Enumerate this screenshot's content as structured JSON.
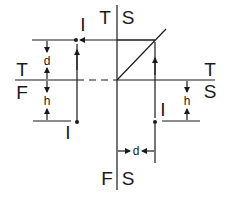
{
  "diagram": {
    "type": "quadrant-transformation-diagram",
    "quadrant_labels": {
      "top_left_axis_upper": "T",
      "top_left_axis_lower": "F",
      "top_axis_left": "T",
      "top_axis_right": "S",
      "right_axis_upper": "T",
      "right_axis_lower": "S",
      "bottom_axis_left": "F",
      "bottom_axis_right": "S"
    },
    "point_labels": {
      "upper_left_point": "I",
      "lower_left_point": "I",
      "lower_right_point": "I"
    },
    "dimensions": {
      "upper_left_vertical": "d",
      "lower_left_vertical": "h",
      "lower_right_vertical": "h",
      "bottom_horizontal": "d"
    },
    "colors": {
      "ink": "#1a1a1a",
      "background": "#ffffff"
    }
  }
}
